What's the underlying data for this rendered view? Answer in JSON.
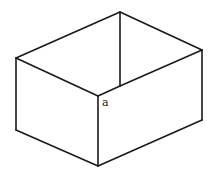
{
  "diagram": {
    "type": "open-box-isometric",
    "stroke_color": "#1a1a1a",
    "background": "#ffffff",
    "vertices": {
      "top_back": [
        120,
        12
      ],
      "left_top": [
        16,
        58
      ],
      "right_top": [
        202,
        50
      ],
      "front_top": [
        98,
        96
      ],
      "inner_bottom": [
        120,
        86
      ],
      "left_bottom": [
        16,
        130
      ],
      "right_bottom": [
        202,
        120
      ],
      "front_bottom": [
        98,
        166
      ]
    },
    "labels": [
      {
        "text": "a",
        "x": 102,
        "y": 97
      }
    ]
  }
}
